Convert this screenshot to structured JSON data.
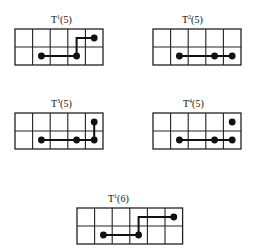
{
  "panels": [
    {
      "id": "t1-5",
      "base": "T",
      "sup": "1",
      "arg": "(5)",
      "cols": 5,
      "rows": 2,
      "dots": [
        [
          4,
          0
        ],
        [
          1,
          1
        ],
        [
          3,
          1
        ]
      ],
      "path": [
        [
          1,
          1
        ],
        [
          3,
          1
        ],
        [
          3,
          0
        ],
        [
          4,
          0
        ]
      ]
    },
    {
      "id": "t2-5",
      "base": "T",
      "sup": "2",
      "arg": "(5)",
      "cols": 5,
      "rows": 2,
      "dots": [
        [
          1,
          1
        ],
        [
          3,
          1
        ],
        [
          4,
          1
        ]
      ],
      "path": [
        [
          1,
          1
        ],
        [
          4,
          1
        ]
      ]
    },
    {
      "id": "t3-5",
      "base": "T",
      "sup": "3",
      "arg": "(5)",
      "cols": 5,
      "rows": 2,
      "dots": [
        [
          4,
          0
        ],
        [
          1,
          1
        ],
        [
          3,
          1
        ],
        [
          4,
          1
        ]
      ],
      "path": [
        [
          1,
          1
        ],
        [
          4,
          1
        ],
        [
          4,
          0
        ]
      ]
    },
    {
      "id": "t4-5",
      "base": "T",
      "sup": "4",
      "arg": "(5)",
      "cols": 5,
      "rows": 2,
      "dots": [
        [
          4,
          0
        ],
        [
          1,
          1
        ],
        [
          3,
          1
        ],
        [
          4,
          1
        ]
      ],
      "path": [
        [
          1,
          1
        ],
        [
          4,
          1
        ]
      ]
    },
    {
      "id": "t1-6",
      "base": "T",
      "sup": "1",
      "arg": "(6)",
      "cols": 6,
      "rows": 2,
      "dots": [
        [
          5,
          0
        ],
        [
          1,
          1
        ],
        [
          3,
          1
        ]
      ],
      "path": [
        [
          1,
          1
        ],
        [
          3,
          1
        ],
        [
          3,
          0
        ],
        [
          5,
          0
        ]
      ]
    }
  ]
}
